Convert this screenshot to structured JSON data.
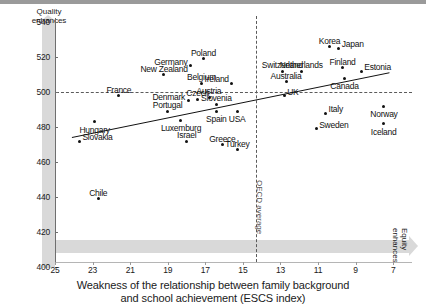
{
  "chart_data": {
    "type": "scatter",
    "title": "",
    "xlabel": "Weakness of the relationship between family background and school achievement (ESCS index)",
    "xlabel_line1": "Weakness of the relationship between family background",
    "xlabel_line2": "and school achievement (ESCS index)",
    "ylabel": "Aggregate national average PISA score",
    "xlim": [
      25,
      6
    ],
    "ylim": [
      400,
      545
    ],
    "x_reversed": true,
    "xticks": [
      "25",
      "23",
      "21",
      "19",
      "17",
      "15",
      "13",
      "11",
      "9",
      "7"
    ],
    "yticks": [
      "400",
      "420",
      "440",
      "460",
      "480",
      "500",
      "520",
      "540"
    ],
    "grid": false,
    "legend": "none",
    "annotations": [
      {
        "name": "quality-enhances",
        "text": "Quality enhances",
        "line1": "Quality",
        "line2": "enhances",
        "position": "top of y-axis arrow"
      },
      {
        "name": "equity-enhances",
        "text": "Equity enhances",
        "line1": "Equity",
        "line2": "enhances",
        "position": "right end of x-axis arrow"
      },
      {
        "name": "oecd-average",
        "text": "OECD average",
        "position": "vertical dashed line at x = 14.3"
      }
    ],
    "reference_lines": [
      {
        "name": "pisa-500-line",
        "orientation": "horizontal",
        "value": 500,
        "style": "dashed"
      },
      {
        "name": "oecd-average-line",
        "orientation": "vertical",
        "value": 14.3,
        "style": "dashed"
      },
      {
        "name": "regression-line",
        "style": "solid",
        "from": {
          "x": 24.1,
          "y": 474
        },
        "to": {
          "x": 7.2,
          "y": 511
        }
      }
    ],
    "points": [
      {
        "label": "Slovakia",
        "x": 23.7,
        "y": 472,
        "label_pos": "right"
      },
      {
        "label": "Hungary",
        "x": 22.9,
        "y": 483,
        "label_pos": "below"
      },
      {
        "label": "Chile",
        "x": 22.7,
        "y": 439,
        "label_pos": "above"
      },
      {
        "label": "France",
        "x": 21.6,
        "y": 498,
        "label_pos": "above"
      },
      {
        "label": "New Zealand",
        "x": 19.2,
        "y": 510,
        "label_pos": "above"
      },
      {
        "label": "Portugal",
        "x": 19.0,
        "y": 489,
        "label_pos": "above"
      },
      {
        "label": "Germany",
        "x": 17.8,
        "y": 515,
        "label_pos": "left"
      },
      {
        "label": "Poland",
        "x": 17.1,
        "y": 519,
        "label_pos": "above"
      },
      {
        "label": "Luxemburg",
        "x": 18.3,
        "y": 484,
        "label_pos": "below"
      },
      {
        "label": "Denmark",
        "x": 17.9,
        "y": 495,
        "label_pos": "left"
      },
      {
        "label": "Israel",
        "x": 18.0,
        "y": 472,
        "label_pos": "above"
      },
      {
        "label": "Czech",
        "x": 17.4,
        "y": 496,
        "label_pos": "above"
      },
      {
        "label": "Belgium",
        "x": 17.2,
        "y": 505,
        "label_pos": "above"
      },
      {
        "label": "Austria",
        "x": 16.8,
        "y": 497,
        "label_pos": "above"
      },
      {
        "label": "Slovenia",
        "x": 16.4,
        "y": 493,
        "label_pos": "above"
      },
      {
        "label": "Spain",
        "x": 16.4,
        "y": 489,
        "label_pos": "below"
      },
      {
        "label": "Ireland",
        "x": 15.6,
        "y": 505,
        "label_pos": "left"
      },
      {
        "label": "Greece",
        "x": 16.1,
        "y": 470,
        "label_pos": "above"
      },
      {
        "label": "USA",
        "x": 15.3,
        "y": 489,
        "label_pos": "below"
      },
      {
        "label": "Turkey",
        "x": 15.3,
        "y": 467,
        "label_pos": "above"
      },
      {
        "label": "Switzerland",
        "x": 12.9,
        "y": 512,
        "label_pos": "above"
      },
      {
        "label": "Australia",
        "x": 12.7,
        "y": 506,
        "label_pos": "above"
      },
      {
        "label": "UK",
        "x": 12.8,
        "y": 498,
        "label_pos": "right"
      },
      {
        "label": "Netherlands",
        "x": 11.9,
        "y": 512,
        "label_pos": "above"
      },
      {
        "label": "Korea",
        "x": 10.4,
        "y": 526,
        "label_pos": "above"
      },
      {
        "label": "Japan",
        "x": 9.9,
        "y": 525,
        "label_pos": "right"
      },
      {
        "label": "Finland",
        "x": 9.7,
        "y": 514,
        "label_pos": "above"
      },
      {
        "label": "Canada",
        "x": 9.6,
        "y": 508,
        "label_pos": "below"
      },
      {
        "label": "Estonia",
        "x": 8.7,
        "y": 512,
        "label_pos": "right"
      },
      {
        "label": "Italy",
        "x": 10.6,
        "y": 488,
        "label_pos": "right"
      },
      {
        "label": "Sweden",
        "x": 11.1,
        "y": 479,
        "label_pos": "right"
      },
      {
        "label": "Norway",
        "x": 7.5,
        "y": 492,
        "label_pos": "below"
      },
      {
        "label": "Iceland",
        "x": 7.5,
        "y": 482,
        "label_pos": "below"
      }
    ]
  }
}
